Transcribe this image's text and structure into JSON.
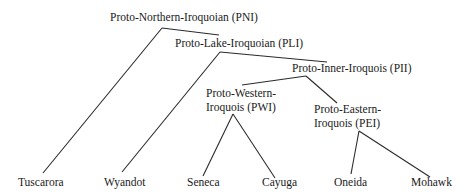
{
  "nodes": {
    "pni": {
      "label": "Proto-Northern-Iroquoian (PNI)"
    },
    "pli": {
      "label": "Proto-Lake-Iroquoian (PLI)"
    },
    "pii": {
      "label": "Proto-Inner-Iroquois (PII)"
    },
    "pwi": {
      "line1": "Proto-Western-",
      "line2": "Iroquois (PWI)"
    },
    "pei": {
      "line1": "Proto-Eastern-",
      "line2": "Iroquois (PEI)"
    },
    "tuscarora": {
      "label": "Tuscarora"
    },
    "wyandot": {
      "label": "Wyandot"
    },
    "seneca": {
      "label": "Seneca"
    },
    "cayuga": {
      "label": "Cayuga"
    },
    "oneida": {
      "label": "Oneida"
    },
    "mohawk": {
      "label": "Mohawk"
    }
  },
  "edges": [
    {
      "from": "pni",
      "to": "tuscarora"
    },
    {
      "from": "pni",
      "to": "pli"
    },
    {
      "from": "pli",
      "to": "wyandot"
    },
    {
      "from": "pli",
      "to": "pii"
    },
    {
      "from": "pii",
      "to": "pwi"
    },
    {
      "from": "pii",
      "to": "pei"
    },
    {
      "from": "pwi",
      "to": "seneca"
    },
    {
      "from": "pwi",
      "to": "cayuga"
    },
    {
      "from": "pei",
      "to": "oneida"
    },
    {
      "from": "pei",
      "to": "mohawk"
    }
  ]
}
